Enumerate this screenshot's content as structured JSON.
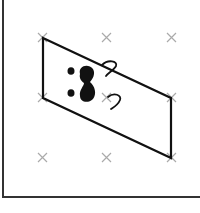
{
  "figure": {
    "grid_marker_color": "#aaaaaa",
    "stroke_color": "#111111"
  }
}
